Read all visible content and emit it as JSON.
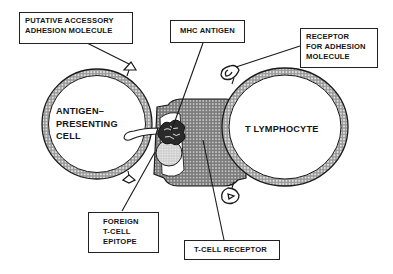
{
  "diagram": {
    "type": "immunology-schematic",
    "colors": {
      "ink": "#1a1a1a",
      "membrane_fill": "#8c8c8c",
      "background": "#ffffff"
    },
    "cells": {
      "apc": {
        "lines": [
          "ANTIGEN–",
          "PRESENTING",
          "CELL"
        ]
      },
      "t_cell": {
        "lines": [
          "T LYMPHOCYTE"
        ]
      }
    },
    "callouts": {
      "putative_accessory": {
        "lines": [
          "PUTATIVE  ACCESSORY",
          "ADHESION MOLECULE"
        ]
      },
      "mhc_antigen": {
        "lines": [
          "MHC  ANTIGEN"
        ]
      },
      "receptor_adhesion": {
        "lines": [
          "RECEPTOR",
          "FOR ADHESION",
          "MOLECULE"
        ]
      },
      "foreign_epitope": {
        "lines": [
          "FOREIGN",
          "T-CELL",
          "EPITOPE"
        ]
      },
      "tcell_receptor": {
        "lines": [
          "T-CELL  RECEPTOR"
        ]
      }
    }
  }
}
